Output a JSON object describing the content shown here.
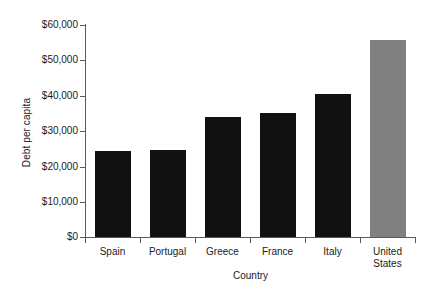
{
  "chart_data": {
    "type": "bar",
    "title": "",
    "subtitle": "",
    "xlabel": "Country",
    "ylabel": "Debt per capita",
    "categories": [
      "Spain",
      "Portugal",
      "Greece",
      "France",
      "Italy",
      "United States"
    ],
    "values": [
      24400,
      24700,
      34000,
      35100,
      40500,
      55800
    ],
    "ylim": [
      0,
      60000
    ],
    "ytick_labels": [
      "$60,000",
      "$50,000",
      "$40,000",
      "$30,000",
      "$20,000",
      "$10,000",
      "$0"
    ],
    "ytick_values": [
      60000,
      50000,
      40000,
      30000,
      20000,
      10000,
      0
    ],
    "grid": false,
    "legend": "none",
    "series": [
      {
        "name": "Debt per capita",
        "values": [
          24400,
          24700,
          34000,
          35100,
          40500,
          55800
        ]
      }
    ],
    "bar_colors": [
      "#111111",
      "#111111",
      "#111111",
      "#111111",
      "#111111",
      "#808080"
    ],
    "colors": {
      "bar_default": "#111111",
      "bar_highlight": "#808080",
      "axis": "#595959",
      "background": "#ffffff",
      "text": "#1a1a1a"
    }
  }
}
